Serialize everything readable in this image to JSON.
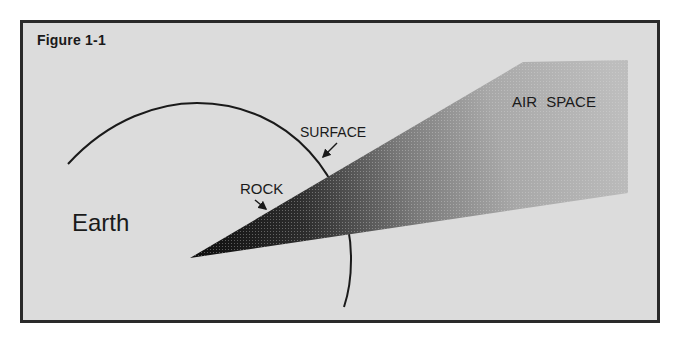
{
  "figure": {
    "label": "Figure 1-1"
  },
  "labels": {
    "earth": "Earth",
    "surface": "SURFACE",
    "rock": "ROCK",
    "air_space": "AIR SPACE"
  },
  "colors": {
    "background": "#dcdcdc",
    "frame_border": "#2a2a2a",
    "wedge_dark": "#111111",
    "wedge_light": "#b8b8b8",
    "text": "#1a1a1a"
  }
}
